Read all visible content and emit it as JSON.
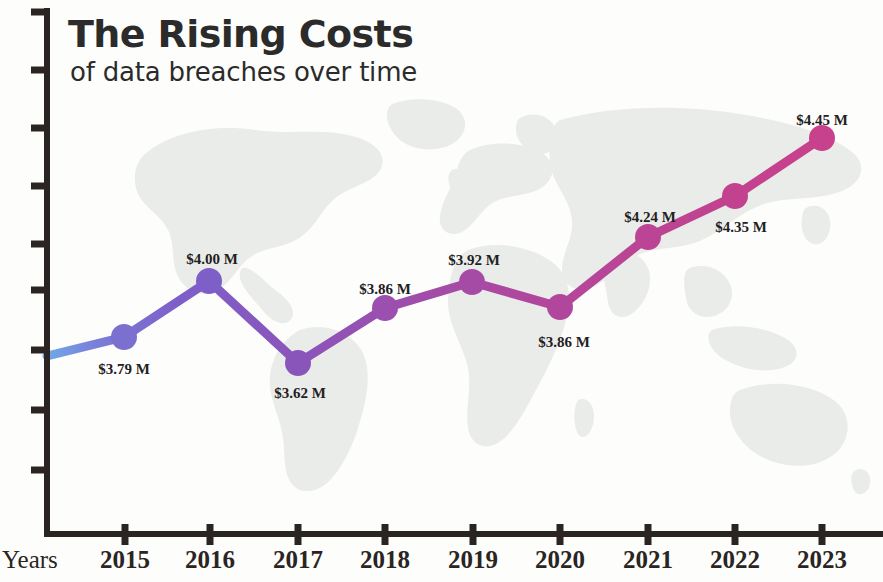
{
  "header": {
    "title": "The Rising Costs",
    "subtitle": "of data breaches over time"
  },
  "axis": {
    "x_name": "Years"
  },
  "style": {
    "line_start_color": "#6fa8e8",
    "line_mid_color": "#7b5fc4",
    "line_end_color": "#c2428f",
    "map_color": "#e9ece9",
    "axis_color": "#2a2523",
    "text_color": "#23201f",
    "background": "#fdfdfc"
  },
  "chart_data": {
    "type": "line",
    "title": "The Rising Costs",
    "subtitle": "of data breaches over time",
    "xlabel": "Years",
    "ylabel": "",
    "categories": [
      "2015",
      "2016",
      "2017",
      "2018",
      "2019",
      "2020",
      "2021",
      "2022",
      "2023"
    ],
    "values": [
      3.79,
      4.0,
      3.62,
      3.86,
      3.92,
      3.86,
      4.24,
      4.35,
      4.45
    ],
    "value_labels": [
      "$3.79 M",
      "$4.00 M",
      "$3.62 M",
      "$3.86 M",
      "$3.92 M",
      "$3.86 M",
      "$4.24 M",
      "$4.35 M",
      "$4.45 M"
    ],
    "unit": "M",
    "currency": "$",
    "grid": false,
    "legend": false,
    "y_ticks_labeled": false,
    "y_tick_count": 9,
    "points": [
      {
        "category": "2015",
        "value": 3.79,
        "label": "$3.79 M",
        "px": 124,
        "py": 337,
        "label_x": 124,
        "label_y": 361,
        "color": "#7b6fd0"
      },
      {
        "category": "2016",
        "value": 4.0,
        "label": "$4.00 M",
        "px": 209,
        "py": 281,
        "label_x": 212,
        "label_y": 251,
        "color": "#7e5fc8"
      },
      {
        "category": "2017",
        "value": 3.62,
        "label": "$3.62 M",
        "px": 298,
        "py": 363,
        "label_x": 300,
        "label_y": 385,
        "color": "#8a55bb"
      },
      {
        "category": "2018",
        "value": 3.86,
        "label": "$3.86 M",
        "px": 385,
        "py": 308,
        "label_x": 385,
        "label_y": 281,
        "color": "#9b4fae"
      },
      {
        "category": "2019",
        "value": 3.92,
        "label": "$3.92 M",
        "px": 472,
        "py": 282,
        "label_x": 474,
        "label_y": 252,
        "color": "#a54ba6"
      },
      {
        "category": "2020",
        "value": 3.86,
        "label": "$3.86 M",
        "px": 560,
        "py": 307,
        "label_x": 564,
        "label_y": 334,
        "color": "#b0479d"
      },
      {
        "category": "2021",
        "value": 4.24,
        "label": "$4.24 M",
        "px": 648,
        "py": 237,
        "label_x": 650,
        "label_y": 209,
        "color": "#bb4494"
      },
      {
        "category": "2022",
        "value": 4.35,
        "label": "$4.35 M",
        "px": 735,
        "py": 196,
        "label_x": 741,
        "label_y": 219,
        "color": "#c2428f"
      },
      {
        "category": "2023",
        "value": 4.45,
        "label": "$4.45 M",
        "px": 822,
        "py": 138,
        "label_x": 822,
        "label_y": 112,
        "color": "#c8418c"
      }
    ],
    "x_ticks_px": [
      125,
      210,
      298,
      385,
      473,
      560,
      648,
      735,
      822
    ],
    "y_ticks_px": [
      12,
      70,
      128,
      186,
      244,
      290,
      350,
      410,
      470
    ]
  }
}
